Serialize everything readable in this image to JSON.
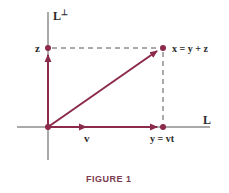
{
  "figure": {
    "caption": "FIGURE 1",
    "axes": {
      "horizontal_label": "L",
      "vertical_label": "L",
      "vertical_label_superscript": "⊥"
    },
    "points": {
      "z_label": "z",
      "x_label": "x = y + z",
      "y_label": "y = vt"
    },
    "vectors": {
      "v_label": "v"
    },
    "colors": {
      "vector": "#8b2a4a",
      "axis": "#555555",
      "dashed": "#555555",
      "caption": "#7a3a50"
    }
  }
}
